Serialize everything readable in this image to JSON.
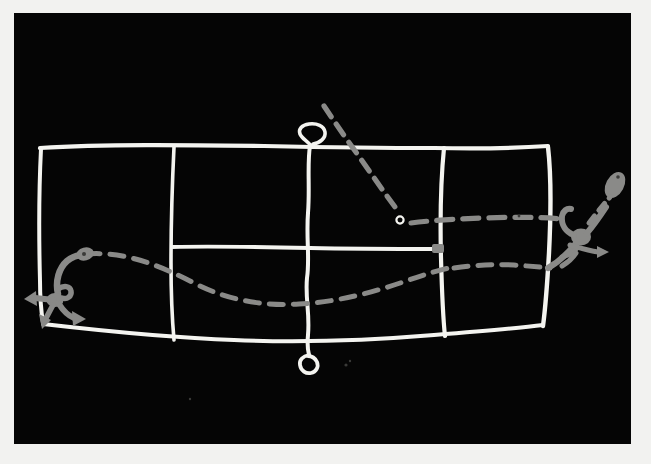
{
  "scene": {
    "title": "Hand-drawn whiteboard sketch",
    "medium": "white chalk on black board",
    "board_color": "#050505",
    "mount_color": "#f2f2f0",
    "chalk_color": "#f4f4f0",
    "annotation_color": "#8a8a88"
  },
  "diagram": {
    "kind": "hand-drawn grid with flow arrows",
    "grid": {
      "label": "chalk grid",
      "columns": 4,
      "rows": 2,
      "note": "upper band spans full width; lower band split by partial divider"
    },
    "elements": [
      {
        "id": "grid-outline",
        "name": "grid-outline",
        "color": "#f4f4f0"
      },
      {
        "id": "vertical-divider-1",
        "name": "vertical-divider-1",
        "color": "#f4f4f0"
      },
      {
        "id": "vertical-divider-2",
        "name": "vertical-divider-2",
        "color": "#f4f4f0"
      },
      {
        "id": "vertical-divider-3",
        "name": "vertical-divider-3",
        "color": "#f4f4f0"
      },
      {
        "id": "horizontal-divider",
        "name": "horizontal-divider",
        "color": "#f4f4f0"
      },
      {
        "id": "top-loop",
        "name": "top-loop-marker",
        "color": "#f4f4f0"
      },
      {
        "id": "bottom-loop",
        "name": "bottom-loop-marker",
        "color": "#f4f4f0"
      },
      {
        "id": "small-circle",
        "name": "small-circle-marker",
        "color": "#f4f4f0"
      },
      {
        "id": "left-arrow-cluster",
        "name": "left-arrow-cluster",
        "color": "#8a8a88"
      },
      {
        "id": "right-arrow-cluster",
        "name": "right-arrow-cluster",
        "color": "#8a8a88"
      },
      {
        "id": "dashed-diagonal",
        "name": "dashed-diagonal-path",
        "color": "#8a8a88"
      },
      {
        "id": "dashed-lower-curve",
        "name": "dashed-lower-curve-path",
        "color": "#8a8a88"
      },
      {
        "id": "dashed-right-curve",
        "name": "dashed-right-curve-path",
        "color": "#8a8a88"
      }
    ]
  },
  "annotations": {
    "text_items": []
  }
}
